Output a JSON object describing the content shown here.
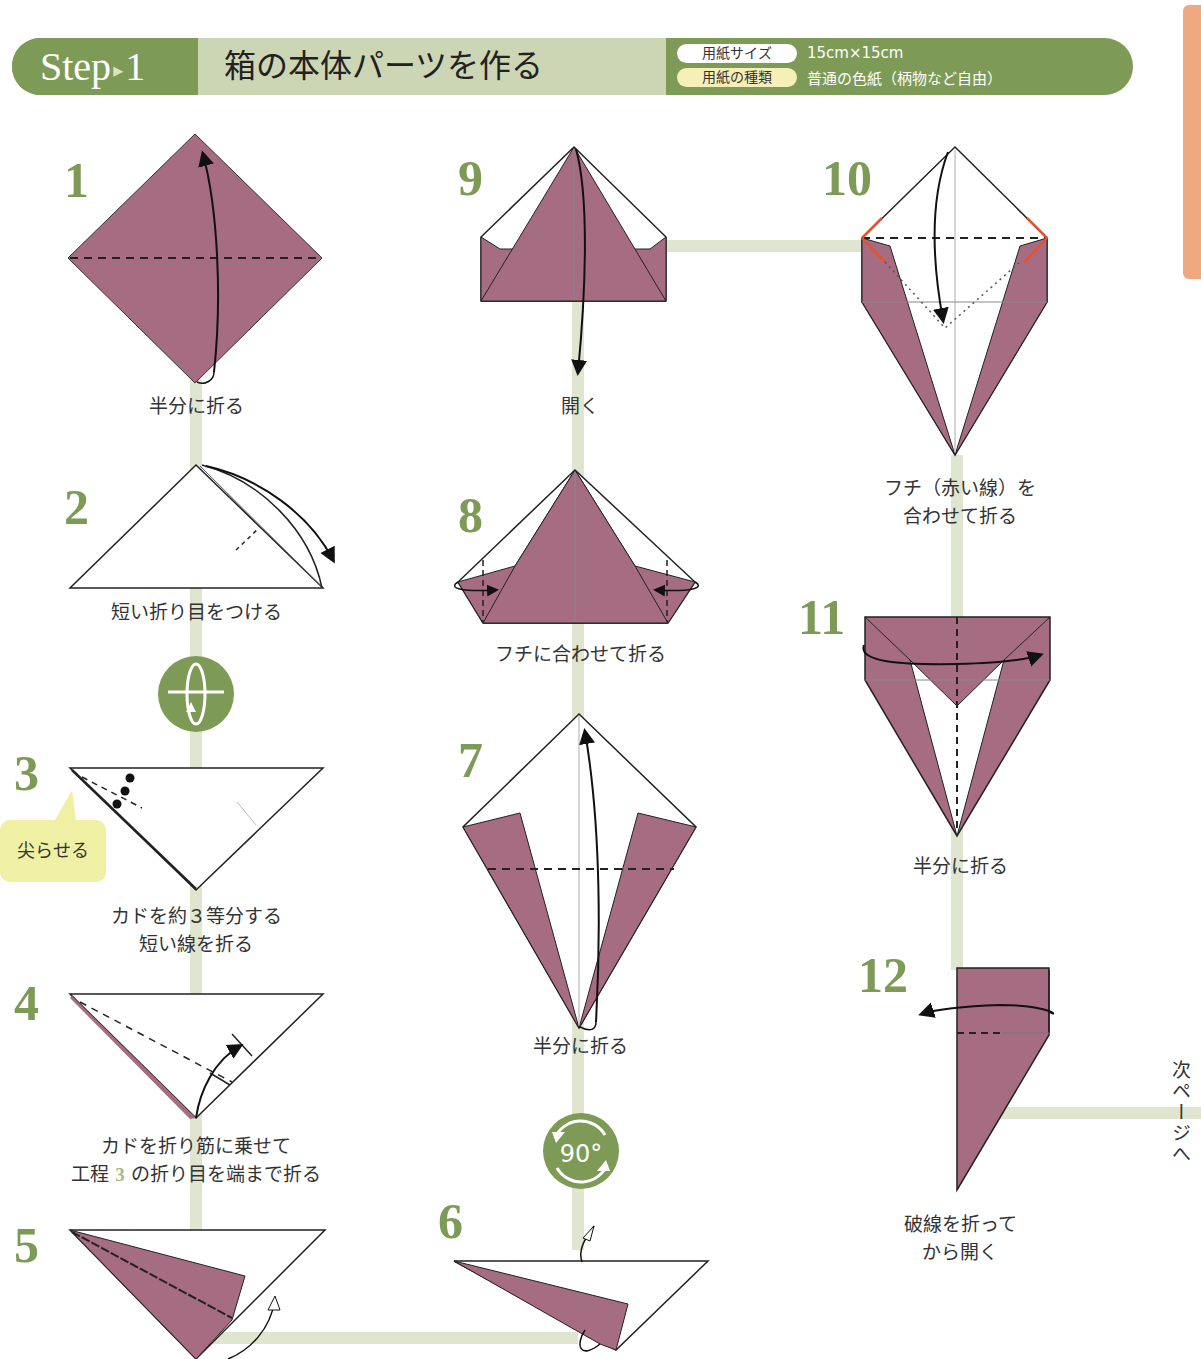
{
  "header": {
    "step_label": "Step",
    "step_arrow": "▸",
    "step_number": "1",
    "title": "箱の本体パーツを作る",
    "info": [
      {
        "label": "用紙サイズ",
        "value": "15cm×15cm"
      },
      {
        "label": "用紙の種類",
        "value": "普通の色紙（柄物など自由）"
      }
    ]
  },
  "colors": {
    "accent_green": "#7e9a57",
    "light_green": "#cdd6b4",
    "path_green": "#dfe5cf",
    "paper_mauve": "#a66d82",
    "tab_orange": "#f0a880",
    "bubble_yellow": "#f0f0a4",
    "red_edge": "#e8502e"
  },
  "steps": [
    {
      "number": "1",
      "caption": [
        "半分に折る"
      ]
    },
    {
      "number": "2",
      "caption": [
        "短い折り目をつける"
      ]
    },
    {
      "number": "3",
      "caption": [
        "カドを約３等分する",
        "短い線を折る"
      ],
      "bubble": "尖らせる"
    },
    {
      "number": "4",
      "caption": [
        "カドを折り筋に乗せて",
        "工程",
        "3",
        "の折り目を端まで折る"
      ]
    },
    {
      "number": "5",
      "caption": []
    },
    {
      "number": "6",
      "caption": []
    },
    {
      "number": "7",
      "caption": [
        "半分に折る"
      ]
    },
    {
      "number": "8",
      "caption": [
        "フチに合わせて折る"
      ]
    },
    {
      "number": "9",
      "caption": [
        "開く"
      ]
    },
    {
      "number": "10",
      "caption": [
        "フチ（赤い線）を",
        "合わせて折る"
      ]
    },
    {
      "number": "11",
      "caption": [
        "半分に折る"
      ]
    },
    {
      "number": "12",
      "caption": [
        "破線を折って",
        "から開く"
      ]
    }
  ],
  "symbols": {
    "flip_over": "flip-over",
    "rotate": "90°"
  },
  "next_page": "次ページへ"
}
